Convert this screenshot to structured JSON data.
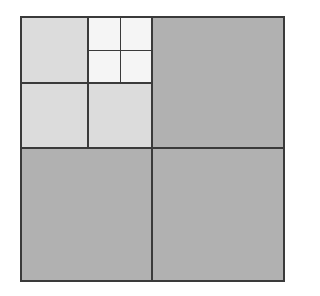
{
  "diagram": {
    "type": "quadtree-subdivision",
    "colors": {
      "level1": "#b1b1b1",
      "level2": "#dcdcdc",
      "level3": "#f5f5f5",
      "line": "#3a3a3a",
      "background": "#ffffff"
    },
    "bounds": {
      "x0": 21,
      "y0": 17,
      "x1": 284,
      "y1": 281
    },
    "cells": [
      {
        "id": "q-tr",
        "level": 1,
        "x0": 152,
        "y0": 17,
        "x1": 284,
        "y1": 148
      },
      {
        "id": "q-bl",
        "level": 1,
        "x0": 21,
        "y0": 148,
        "x1": 152,
        "y1": 281
      },
      {
        "id": "q-br",
        "level": 1,
        "x0": 152,
        "y0": 148,
        "x1": 284,
        "y1": 281
      },
      {
        "id": "q-tl-tl",
        "level": 2,
        "x0": 21,
        "y0": 17,
        "x1": 88,
        "y1": 83
      },
      {
        "id": "q-tl-bl",
        "level": 2,
        "x0": 21,
        "y0": 83,
        "x1": 88,
        "y1": 148
      },
      {
        "id": "q-tl-br",
        "level": 2,
        "x0": 88,
        "y0": 83,
        "x1": 152,
        "y1": 148
      },
      {
        "id": "q-tl-tr-tl",
        "level": 3,
        "x0": 88,
        "y0": 17,
        "x1": 120,
        "y1": 50
      },
      {
        "id": "q-tl-tr-tr",
        "level": 3,
        "x0": 120,
        "y0": 17,
        "x1": 152,
        "y1": 50
      },
      {
        "id": "q-tl-tr-bl",
        "level": 3,
        "x0": 88,
        "y0": 50,
        "x1": 120,
        "y1": 83
      },
      {
        "id": "q-tl-tr-br",
        "level": 3,
        "x0": 120,
        "y0": 50,
        "x1": 152,
        "y1": 83
      }
    ],
    "lines": [
      {
        "id": "outer-top",
        "x0": 21,
        "y0": 17,
        "x1": 284,
        "y1": 17,
        "w": 2
      },
      {
        "id": "outer-bottom",
        "x0": 21,
        "y0": 281,
        "x1": 284,
        "y1": 281,
        "w": 2
      },
      {
        "id": "outer-left",
        "x0": 21,
        "y0": 17,
        "x1": 21,
        "y1": 281,
        "w": 2
      },
      {
        "id": "outer-right",
        "x0": 284,
        "y0": 17,
        "x1": 284,
        "y1": 281,
        "w": 2
      },
      {
        "id": "mid-vertical",
        "x0": 152,
        "y0": 17,
        "x1": 152,
        "y1": 281,
        "w": 2
      },
      {
        "id": "mid-horizontal",
        "x0": 21,
        "y0": 148,
        "x1": 284,
        "y1": 148,
        "w": 2
      },
      {
        "id": "l2-vertical",
        "x0": 88,
        "y0": 17,
        "x1": 88,
        "y1": 148,
        "w": 1.5
      },
      {
        "id": "l2-horizontal",
        "x0": 21,
        "y0": 83,
        "x1": 152,
        "y1": 83,
        "w": 1.5
      },
      {
        "id": "l3-vertical",
        "x0": 120,
        "y0": 17,
        "x1": 120,
        "y1": 83,
        "w": 1
      },
      {
        "id": "l3-horizontal",
        "x0": 88,
        "y0": 50,
        "x1": 152,
        "y1": 50,
        "w": 1
      }
    ]
  }
}
